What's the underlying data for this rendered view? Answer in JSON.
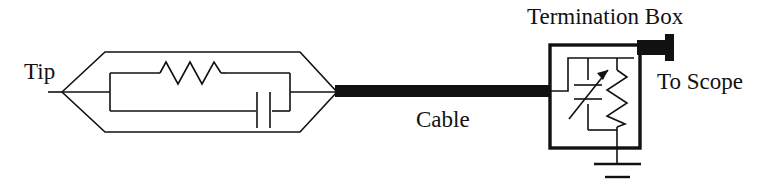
{
  "figure": {
    "kind": "schematic-diagram",
    "background_color": "#ffffff",
    "stroke_color": "#111111"
  },
  "labels": {
    "tip": "Tip",
    "cable": "Cable",
    "termination_box": "Termination Box",
    "to_scope": "To Scope"
  },
  "components": {
    "probe_body": {
      "name": "probe-body-outline",
      "shape": "hexagon"
    },
    "probe_resistor": {
      "name": "probe-resistor",
      "symbol": "resistor-zigzag",
      "orientation": "horizontal",
      "peaks": 3
    },
    "probe_capacitor": {
      "name": "probe-capacitor",
      "symbol": "capacitor-parallel-plates",
      "orientation": "vertical-plates",
      "plates": 2
    },
    "cable": {
      "name": "coaxial-cable",
      "style": "thick-solid-black-bar"
    },
    "termination_box": {
      "name": "termination-box-enclosure",
      "shape": "rectangle"
    },
    "variable_capacitor": {
      "name": "variable-capacitor",
      "symbol": "capacitor-with-arrow",
      "orientation": "horizontal-plates",
      "plates": 2,
      "adjustable": true
    },
    "termination_resistor": {
      "name": "termination-resistor",
      "symbol": "resistor-zigzag",
      "orientation": "vertical",
      "peaks": 4
    },
    "ground": {
      "name": "ground-symbol",
      "symbol": "earth-ground",
      "bars": 2
    },
    "scope_connector": {
      "name": "scope-connector",
      "style": "thick-solid-black-plug"
    }
  }
}
